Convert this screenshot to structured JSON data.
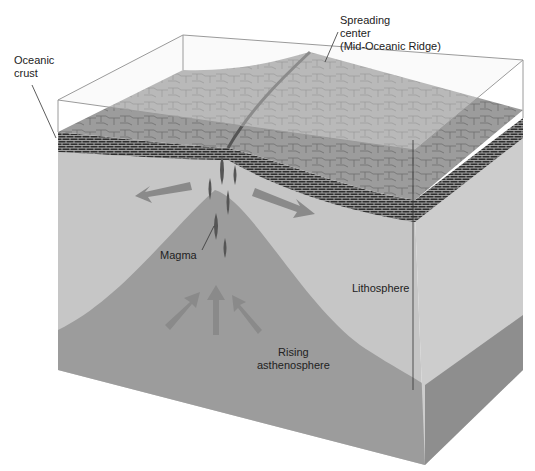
{
  "diagram": {
    "labels": {
      "oceanic_crust": [
        "Oceanic",
        "crust"
      ],
      "spreading_center": [
        "Spreading",
        "center",
        "(Mid-Oceanic Ridge)"
      ],
      "magma": "Magma",
      "lithosphere": "Lithosphere",
      "rising_asthenosphere": [
        "Rising",
        "asthenosphere"
      ]
    },
    "colors": {
      "lithosphere": "#c8c8c8",
      "asthenosphere": "#9a9a9a",
      "crust": "#3a3a3a",
      "seafloor": "#8c8c8c",
      "water": "#e8e8e8",
      "arrow": "#8a8a8a"
    }
  }
}
